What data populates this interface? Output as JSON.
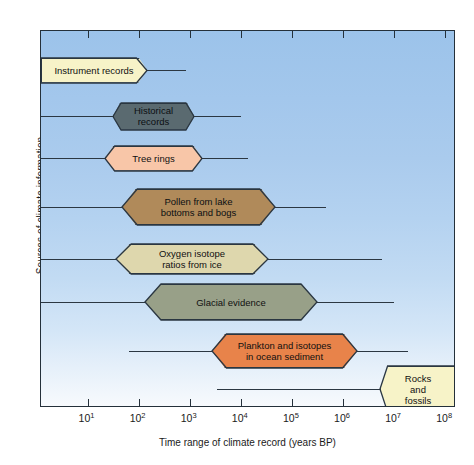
{
  "chart_data": {
    "type": "bar",
    "title": "",
    "xlabel": "Time range of climate record (years BP)",
    "ylabel": "Sources of climate information",
    "x_scale": "log",
    "xlim": [
      1,
      400000000
    ],
    "grid": false,
    "legend": false,
    "xtick_labels": [
      "10¹",
      "10²",
      "10³",
      "10⁴",
      "10⁵",
      "10⁶",
      "10⁷",
      "10⁸"
    ],
    "xtick_bases": [
      "10",
      "10",
      "10",
      "10",
      "10",
      "10",
      "10",
      "10"
    ],
    "xtick_exponents": [
      "1",
      "2",
      "3",
      "4",
      "5",
      "6",
      "7",
      "8"
    ],
    "xtick_values": [
      10,
      100,
      1000,
      10000,
      100000,
      1000000,
      10000000,
      100000000
    ],
    "categories": [
      "Instrument records",
      "Historical records",
      "Tree rings",
      "Pollen from lake bottoms and bogs",
      "Oxygen isotope ratios from ice",
      "Glacial evidence",
      "Plankton and isotopes in ocean sediment",
      "Rocks and fossils"
    ],
    "bars": [
      {
        "label": "Instrument records",
        "label_lines": "Instrument records",
        "color": "#f7f3c8",
        "row_y": 69,
        "height": 25,
        "shape": "flat-left",
        "line_start": 40,
        "line_end": 185,
        "body_start": 40,
        "body_end": 146,
        "range_years_bp": [
          1,
          300
        ]
      },
      {
        "label": "Historical records",
        "label_lines": "Historical\nrecords",
        "color": "#5a6a70",
        "row_y": 115,
        "height": 27,
        "shape": "pointed-both",
        "line_start": 40,
        "line_end": 240,
        "body_start": 112,
        "body_end": 193,
        "range_years_bp": [
          1,
          4000
        ]
      },
      {
        "label": "Tree rings",
        "label_lines": "Tree rings",
        "color": "#f8c6a8",
        "row_y": 157,
        "height": 25,
        "shape": "pointed-both",
        "line_start": 40,
        "line_end": 247,
        "body_start": 104,
        "body_end": 201,
        "range_years_bp": [
          1,
          8000
        ]
      },
      {
        "label": "Pollen from lake bottoms and bogs",
        "label_lines": "Pollen from lake\nbottoms and bogs",
        "color": "#b08a5a",
        "row_y": 206,
        "height": 36,
        "shape": "pointed-both",
        "line_start": 40,
        "line_end": 325,
        "body_start": 121,
        "body_end": 274,
        "range_years_bp": [
          1,
          1000000
        ]
      },
      {
        "label": "Oxygen isotope ratios from ice",
        "label_lines": "Oxygen isotope\nratios from ice",
        "color": "#ded7ad",
        "row_y": 258,
        "height": 30,
        "shape": "pointed-both",
        "line_start": 40,
        "line_end": 381,
        "body_start": 115,
        "body_end": 267,
        "range_years_bp": [
          1,
          20000000
        ]
      },
      {
        "label": "Glacial evidence",
        "label_lines": "Glacial evidence",
        "color": "#98a088",
        "row_y": 301,
        "height": 36,
        "shape": "pointed-both",
        "line_start": 40,
        "line_end": 393,
        "body_start": 144,
        "body_end": 316,
        "range_years_bp": [
          1,
          50000000
        ]
      },
      {
        "label": "Plankton and isotopes in ocean sediment",
        "label_lines": "Plankton and isotopes\nin ocean sediment",
        "color": "#e8834a",
        "row_y": 350,
        "height": 34,
        "shape": "pointed-both",
        "line_start": 128,
        "line_end": 407,
        "body_start": 211,
        "body_end": 356,
        "range_years_bp": [
          3000,
          30000000
        ]
      },
      {
        "label": "Rocks and fossils",
        "label_lines": "Rocks\nand\nfossils",
        "color": "#f7f3c8",
        "row_y": 388,
        "height": 46,
        "shape": "flat-right",
        "line_start": 216,
        "line_end": 395,
        "body_start": 379,
        "body_end": 455,
        "range_years_bp": [
          6000,
          400000000
        ]
      }
    ]
  }
}
